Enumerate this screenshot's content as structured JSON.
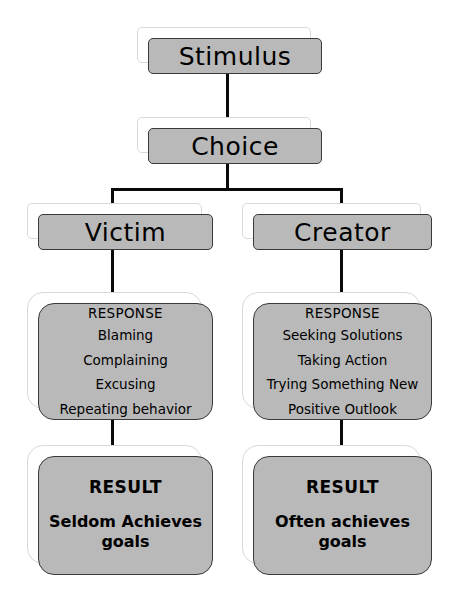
{
  "diagram": {
    "type": "flowchart",
    "top_sliver_text": "",
    "colors": {
      "box_fill": "#b9b9b9",
      "box_border": "#3a3a3a",
      "ghost_border": "#d9d9d9",
      "connector": "#0a0a0a",
      "background": "#ffffff",
      "text": "#000000"
    },
    "nodes": {
      "stimulus": {
        "label": "Stimulus"
      },
      "choice": {
        "label": "Choice"
      },
      "victim": {
        "label": "Victim"
      },
      "creator": {
        "label": "Creator"
      },
      "victim_response": {
        "heading": "RESPONSE",
        "items": [
          "Blaming",
          "Complaining",
          "Excusing",
          "Repeating behavior"
        ]
      },
      "creator_response": {
        "heading": "RESPONSE",
        "items": [
          "Seeking Solutions",
          "Taking Action",
          "Trying Something New",
          "Positive Outlook"
        ]
      },
      "victim_result": {
        "heading": "RESULT",
        "body": "Seldom Achieves goals"
      },
      "creator_result": {
        "heading": "RESULT",
        "body": "Often achieves goals"
      }
    },
    "edges": [
      {
        "from": "stimulus",
        "to": "choice"
      },
      {
        "from": "choice",
        "to": "victim"
      },
      {
        "from": "choice",
        "to": "creator"
      },
      {
        "from": "victim",
        "to": "victim_response"
      },
      {
        "from": "creator",
        "to": "creator_response"
      },
      {
        "from": "victim_response",
        "to": "victim_result"
      },
      {
        "from": "creator_response",
        "to": "creator_result"
      }
    ]
  }
}
